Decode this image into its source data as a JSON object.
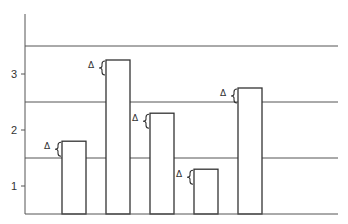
{
  "chart_data": {
    "type": "bar",
    "title": "",
    "xlabel": "",
    "ylabel": "",
    "categories": [
      "1",
      "2",
      "3",
      "4",
      "5"
    ],
    "values": [
      1.8,
      3.25,
      2.3,
      1.3,
      2.75
    ],
    "error_annotation": "Δ",
    "yticks": [
      1,
      2,
      3
    ],
    "ytick_labels": [
      "1",
      "2",
      "3"
    ],
    "gridlines": [
      1.5,
      2.5,
      3.5
    ],
    "ylim": [
      0.5,
      4.0
    ],
    "grid": true,
    "legend": null,
    "colors": {
      "bar_fill": "#ffffff",
      "bar_stroke": "#333333",
      "axis": "#555555",
      "grid": "#555555"
    }
  }
}
